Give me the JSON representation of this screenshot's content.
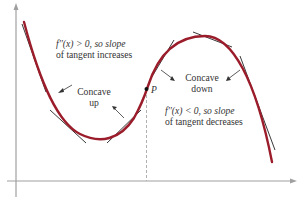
{
  "figure": {
    "annotations": {
      "top_left_line1": "f′′(x) > 0, so slope",
      "top_left_line2": "of tangent increases",
      "concave_up_line1": "Concave",
      "concave_up_line2": "up",
      "concave_down_line1": "Concave",
      "concave_down_line2": "down",
      "bottom_right_line1": "f′′(x) < 0, so slope",
      "bottom_right_line2": "of tangent decreases",
      "inflection_point_label": "P"
    },
    "colors": {
      "curve": "#9b1c2a",
      "tangent": "#222222",
      "axis": "#999999",
      "text": "#333333"
    },
    "icons": {
      "x_axis_arrow": "arrow-right-icon",
      "y_axis_arrow": "arrow-up-icon"
    }
  }
}
